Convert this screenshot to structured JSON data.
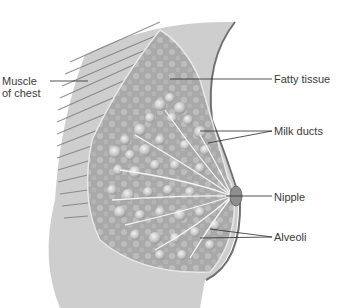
{
  "figure": {
    "labels": {
      "muscle_line1": "Muscle",
      "muscle_line2": "of chest",
      "fatty_tissue": "Fatty tissue",
      "milk_ducts": "Milk ducts",
      "nipple": "Nipple",
      "alveoli": "Alveoli"
    }
  }
}
